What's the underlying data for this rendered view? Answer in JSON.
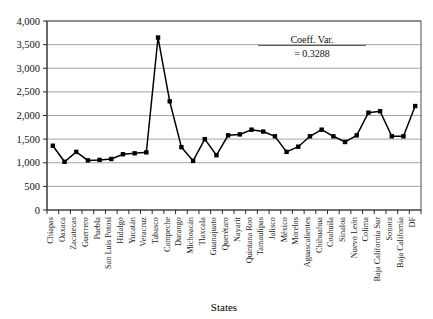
{
  "chart_data": {
    "type": "line",
    "title": "",
    "xlabel": "States",
    "ylabel": "",
    "ylim": [
      0,
      4000
    ],
    "ytick_step": 500,
    "grid": true,
    "legend": "none",
    "marker": "square",
    "line_color": "#000000",
    "marker_color": "#000000",
    "grid_color": "#8e8e8e",
    "ytick_labels": [
      "0",
      "500",
      "1,000",
      "1,500",
      "2,000",
      "2,500",
      "3,000",
      "3,500",
      "4,000"
    ],
    "categories": [
      "Chiapas",
      "Oaxaca",
      "Zacatecas",
      "Guerrero",
      "Puebla",
      "San Luis Potosí",
      "Hidalgo",
      "Yucatán",
      "Veracruz",
      "Tabasco",
      "Campeche",
      "Durango",
      "Michoacán",
      "Tlaxcala",
      "Guanajuato",
      "Querétaro",
      "Nayarit",
      "Quintana Roo",
      "Tamaulipas",
      "Jalisco",
      "México",
      "Morelos",
      "Aguascalientes",
      "Chihuahua",
      "Coahuila",
      "Sinaloa",
      "Nuevo León",
      "Colima",
      "Baja California Sur",
      "Sonora",
      "Baja California",
      "DF"
    ],
    "values": [
      1360,
      1020,
      1230,
      1050,
      1060,
      1080,
      1180,
      1200,
      1220,
      3650,
      2300,
      1330,
      1040,
      1500,
      1160,
      1580,
      1600,
      1700,
      1660,
      1560,
      1230,
      1340,
      1560,
      1700,
      1560,
      1440,
      1580,
      2060,
      2090,
      1560,
      1560,
      2200
    ],
    "annotation": {
      "line1": "Coeff. Var.",
      "line2": "= 0.3288"
    }
  }
}
